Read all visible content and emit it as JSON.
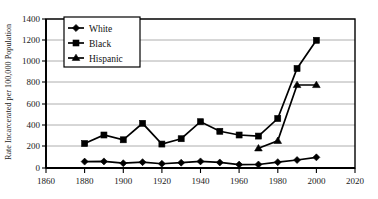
{
  "chart_data": {
    "type": "line",
    "title": "",
    "xlabel": "",
    "ylabel": "Rate Incarcerated per 100,000 Population",
    "xlim": [
      1860,
      2020
    ],
    "ylim": [
      0,
      1400
    ],
    "xticks": [
      1860,
      1880,
      1900,
      1920,
      1940,
      1960,
      1980,
      2000,
      2020
    ],
    "yticks": [
      0,
      200,
      400,
      600,
      800,
      1000,
      1200,
      1400
    ],
    "grid": "horizontal",
    "legend_position": "top-left-inside",
    "series": [
      {
        "name": "White",
        "marker": "diamond",
        "x": [
          1880,
          1890,
          1900,
          1910,
          1920,
          1930,
          1940,
          1950,
          1960,
          1970,
          1980,
          1990,
          2000
        ],
        "values": [
          60,
          62,
          45,
          55,
          40,
          50,
          62,
          52,
          32,
          33,
          55,
          75,
          100
        ]
      },
      {
        "name": "Black",
        "marker": "square",
        "x": [
          1880,
          1890,
          1900,
          1910,
          1920,
          1930,
          1940,
          1950,
          1960,
          1970,
          1980,
          1990,
          2000
        ],
        "values": [
          230,
          310,
          265,
          420,
          225,
          275,
          435,
          345,
          310,
          300,
          465,
          935,
          1200
        ]
      },
      {
        "name": "Hispanic",
        "marker": "triangle",
        "x": [
          1970,
          1980,
          1990,
          2000
        ],
        "values": [
          185,
          255,
          780,
          780
        ]
      }
    ]
  },
  "axis": {
    "y_title": "Rate Incarcerated per 100,000 Population",
    "y_tick_labels": [
      "0",
      "200",
      "400",
      "600",
      "800",
      "1000",
      "1200",
      "1400"
    ],
    "x_tick_labels": [
      "1860",
      "1880",
      "1900",
      "1920",
      "1940",
      "1960",
      "1980",
      "2000",
      "2020"
    ]
  },
  "legend": {
    "entries": [
      {
        "label": "White",
        "marker": "diamond-marker-icon"
      },
      {
        "label": "Black",
        "marker": "square-marker-icon"
      },
      {
        "label": "Hispanic",
        "marker": "triangle-marker-icon"
      }
    ]
  },
  "colors": {
    "ink": "#000000",
    "grid": "#9a9a9a",
    "background": "#ffffff"
  }
}
